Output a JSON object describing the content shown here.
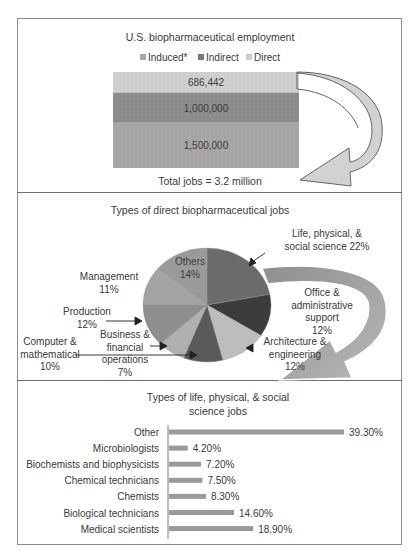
{
  "chart_data": [
    {
      "type": "bar",
      "stacked": true,
      "title": "U.S. biopharmaceutical employment",
      "legend": [
        "Induced*",
        "Indirect",
        "Direct"
      ],
      "legend_position": "top",
      "colors": {
        "Induced*": "#a6a6a6",
        "Indirect": "#8c8c8c",
        "Direct": "#cfcfcf"
      },
      "series": [
        {
          "name": "Direct",
          "value": 686442,
          "label": "686,442"
        },
        {
          "name": "Indirect",
          "value": 1000000,
          "label": "1,000,000"
        },
        {
          "name": "Induced*",
          "value": 1500000,
          "label": "1,500,000"
        }
      ],
      "annotation": "Total jobs = 3.2 million"
    },
    {
      "type": "pie",
      "title": "Types of direct biopharmaceutical jobs",
      "slices": [
        {
          "label": "Life, physical, & social science",
          "value": 22,
          "display": [
            "Life, physical, &",
            "social science 22%"
          ],
          "color": "#6b6b6b"
        },
        {
          "label": "Office & administrative support",
          "value": 12,
          "display": [
            "Office &",
            "administrative",
            "support",
            "12%"
          ],
          "color": "#3c3c3c"
        },
        {
          "label": "Architecture & engineering",
          "value": 12,
          "display": [
            "Architecture &",
            "engineering",
            "12%"
          ],
          "color": "#bdbdbd"
        },
        {
          "label": "Computer & mathematical",
          "value": 10,
          "display": [
            "Computer &",
            "mathematical",
            "10%"
          ],
          "color": "#5a5a5a"
        },
        {
          "label": "Business & financial operations",
          "value": 7,
          "display": [
            "Business &",
            "financial",
            "operations",
            "7%"
          ],
          "color": "#b0b0b0"
        },
        {
          "label": "Production",
          "value": 12,
          "display": [
            "Production",
            "12%"
          ],
          "color": "#8e8e8e"
        },
        {
          "label": "Management",
          "value": 11,
          "display": [
            "Management",
            "11%"
          ],
          "color": "#a3a3a3"
        },
        {
          "label": "Others",
          "value": 14,
          "display": [
            "Others",
            "14%"
          ],
          "color": "#9a9a9a"
        }
      ]
    },
    {
      "type": "bar",
      "orientation": "horizontal",
      "title": "Types of life, physical, & social science jobs",
      "title_lines": [
        "Types of life, physical, & social",
        "science jobs"
      ],
      "categories": [
        "Other",
        "Microbiologists",
        "Biochemists and biophysicists",
        "Chemical technicians",
        "Chemists",
        "Biological technicians",
        "Medical scientists"
      ],
      "values": [
        39.3,
        4.2,
        7.2,
        7.5,
        8.3,
        14.6,
        18.9
      ],
      "labels": [
        "39.30%",
        "4.20%",
        "7.20%",
        "7.50%",
        "8.30%",
        "14.60%",
        "18.90%"
      ],
      "color": "#9a9a9a",
      "xlim": [
        0,
        40
      ]
    }
  ]
}
